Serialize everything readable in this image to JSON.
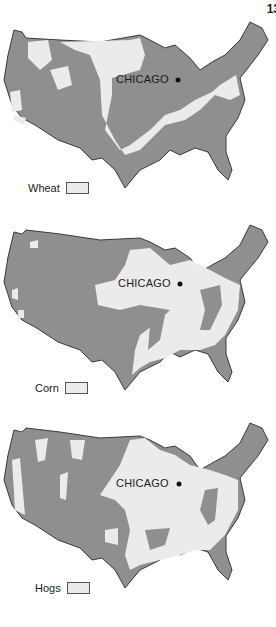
{
  "page_number": "13",
  "colors": {
    "dark": "#8f8f8f",
    "light": "#ebebeb",
    "outline": "#3a3a3a"
  },
  "maps": [
    {
      "id": "wheat",
      "city_label": "CHICAGO",
      "legend_label": "Wheat"
    },
    {
      "id": "corn",
      "city_label": "CHICAGO",
      "legend_label": "Corn"
    },
    {
      "id": "hogs",
      "city_label": "CHICAGO",
      "legend_label": "Hogs"
    }
  ]
}
